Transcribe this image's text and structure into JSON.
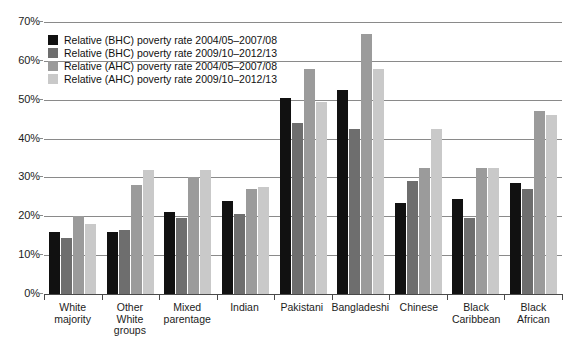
{
  "chart_data": {
    "type": "bar",
    "title": "",
    "xlabel": "",
    "ylabel": "",
    "ylim": [
      0,
      70
    ],
    "ytick_labels": [
      "0%",
      "10%",
      "20%",
      "30%",
      "40%",
      "50%",
      "60%",
      "70%"
    ],
    "ytick_values": [
      0,
      10,
      20,
      30,
      40,
      50,
      60,
      70
    ],
    "grid": true,
    "legend_position": "top-left",
    "categories": [
      "White majority",
      "Other White groups",
      "Mixed parentage",
      "Indian",
      "Pakistani",
      "Bangladeshi",
      "Chinese",
      "Black Caribbean",
      "Black African"
    ],
    "series": [
      {
        "name": "Relative (BHC) poverty rate 2004/05–2007/08",
        "color": "#111111",
        "values": [
          16,
          16,
          21,
          24,
          50.5,
          52.5,
          23.5,
          24.5,
          28.5
        ]
      },
      {
        "name": "Relative (BHC) poverty rate 2009/10–2012/13",
        "color": "#6e6e6e",
        "values": [
          14.5,
          16.5,
          19.5,
          20.5,
          44,
          42.5,
          29,
          19.5,
          27
        ]
      },
      {
        "name": "Relative (AHC) poverty rate 2004/05–2007/08",
        "color": "#9b9b9b",
        "values": [
          20,
          28,
          30,
          27,
          58,
          67,
          32.5,
          32.5,
          47
        ]
      },
      {
        "name": "Relative (AHC) poverty rate 2009/10–2012/13",
        "color": "#c9c9c9",
        "values": [
          18,
          32,
          32,
          27.5,
          49.5,
          58,
          42.5,
          32.5,
          46
        ]
      }
    ]
  }
}
